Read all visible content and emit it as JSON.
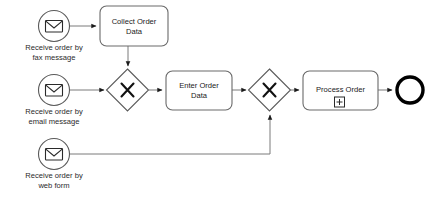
{
  "diagram": {
    "type": "bpmn-process-diagram",
    "background_color": "#ffffff",
    "stroke_color": "#555555",
    "text_color": "#1a1a1a",
    "end_event_color": "#000000"
  },
  "events": {
    "start_fax": {
      "kind": "message-start-event",
      "icon": "envelope-icon",
      "label": "Receive order by\nfax message"
    },
    "start_email": {
      "kind": "message-start-event",
      "icon": "envelope-icon",
      "label": "Receive order by\nemail message"
    },
    "start_web": {
      "kind": "message-start-event",
      "icon": "envelope-icon",
      "label": "Receive order by\nweb form"
    },
    "end_event": {
      "kind": "end-event",
      "label": ""
    }
  },
  "tasks": {
    "collect_order_data": {
      "label": "Collect Order\nData",
      "marker": ""
    },
    "enter_order_data": {
      "label": "Enter Order\nData",
      "marker": ""
    },
    "process_order": {
      "label": "Process Order",
      "marker": "plus-box-icon"
    }
  },
  "gateways": {
    "gateway_merge": {
      "kind": "exclusive-gateway",
      "symbol": "X",
      "label": ""
    },
    "gateway_join": {
      "kind": "exclusive-gateway",
      "symbol": "X",
      "label": ""
    }
  },
  "flows": [
    {
      "from": "start_fax",
      "to": "collect_order_data"
    },
    {
      "from": "collect_order_data",
      "to": "gateway_merge"
    },
    {
      "from": "start_email",
      "to": "gateway_merge"
    },
    {
      "from": "gateway_merge",
      "to": "enter_order_data"
    },
    {
      "from": "enter_order_data",
      "to": "gateway_join"
    },
    {
      "from": "start_web",
      "to": "gateway_join"
    },
    {
      "from": "gateway_join",
      "to": "process_order"
    },
    {
      "from": "process_order",
      "to": "end_event"
    }
  ]
}
